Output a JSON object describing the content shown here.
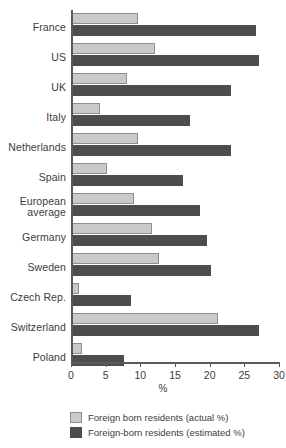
{
  "chart_data": {
    "type": "bar",
    "orientation": "horizontal",
    "title": "",
    "xlabel": "%",
    "ylabel": "",
    "xlim": [
      0,
      30
    ],
    "xticks": [
      0,
      5,
      10,
      15,
      20,
      25,
      30
    ],
    "grid": false,
    "legend_position": "bottom-left",
    "categories": [
      "France",
      "US",
      "UK",
      "Italy",
      "Netherlands",
      "Spain",
      "European average",
      "Germany",
      "Sweden",
      "Czech Rep.",
      "Switzerland",
      "Poland"
    ],
    "series": [
      {
        "name": "Foreign born residents (actual %)",
        "color": "#c9c9c9",
        "values": [
          9.5,
          12.0,
          8.0,
          4.0,
          9.5,
          5.0,
          9.0,
          11.5,
          12.5,
          1.0,
          21.0,
          1.5
        ]
      },
      {
        "name": "Foreign-born residents (estimated %)",
        "color": "#4d4d4d",
        "values": [
          26.5,
          27.0,
          23.0,
          17.0,
          23.0,
          16.0,
          18.5,
          19.5,
          20.0,
          8.5,
          27.0,
          7.5
        ]
      }
    ]
  },
  "legend": {
    "items": [
      {
        "label": "Foreign born residents (actual %)",
        "swatch": "actual"
      },
      {
        "label": "Foreign-born residents (estimated %)",
        "swatch": "estimated"
      }
    ]
  },
  "axis": {
    "x_title": "%"
  },
  "colors": {
    "actual": "#c9c9c9",
    "estimated": "#4d4d4d",
    "axis": "#5a5a5a",
    "text": "#3c3c3c"
  }
}
